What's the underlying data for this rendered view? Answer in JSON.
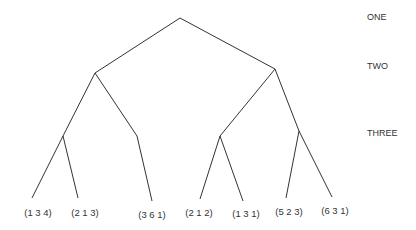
{
  "diagram": {
    "type": "tree",
    "level_labels": [
      {
        "label": "ONE",
        "x": 367,
        "y": 20
      },
      {
        "label": "TWO",
        "x": 367,
        "y": 69
      },
      {
        "label": "THREE",
        "x": 367,
        "y": 136
      }
    ],
    "nodes": {
      "root": {
        "x": 180,
        "y": 18
      },
      "L": {
        "x": 95,
        "y": 73
      },
      "R": {
        "x": 275,
        "y": 69
      },
      "LL": {
        "x": 63,
        "y": 136
      },
      "LR": {
        "x": 137,
        "y": 136
      },
      "RL": {
        "x": 220,
        "y": 136
      },
      "RR": {
        "x": 299,
        "y": 131
      }
    },
    "leaves": [
      {
        "label": "(1 3 4)",
        "x": 32,
        "y": 198,
        "label_x": 38,
        "label_y": 216
      },
      {
        "label": "(2 1 3)",
        "x": 78,
        "y": 198,
        "label_x": 85,
        "label_y": 216
      },
      {
        "label": "(3 6 1)",
        "x": 152,
        "y": 201,
        "label_x": 152,
        "label_y": 218
      },
      {
        "label": "(2 1 2)",
        "x": 200,
        "y": 199,
        "label_x": 199,
        "label_y": 216
      },
      {
        "label": "(1 3 1)",
        "x": 243,
        "y": 201,
        "label_x": 246,
        "label_y": 217
      },
      {
        "label": "(5 2 3)",
        "x": 286,
        "y": 198,
        "label_x": 289,
        "label_y": 215
      },
      {
        "label": "(6 3 1)",
        "x": 332,
        "y": 197,
        "label_x": 335,
        "label_y": 214
      }
    ],
    "edges": [
      [
        "root",
        "L"
      ],
      [
        "root",
        "R"
      ],
      [
        "L",
        "LL"
      ],
      [
        "L",
        "LR"
      ],
      [
        "R",
        "RL"
      ],
      [
        "R",
        "RR"
      ],
      [
        "LL",
        "leaf0"
      ],
      [
        "LL",
        "leaf1"
      ],
      [
        "LR",
        "leaf2"
      ],
      [
        "RL",
        "leaf3"
      ],
      [
        "RL",
        "leaf4"
      ],
      [
        "RR",
        "leaf5"
      ],
      [
        "RR",
        "leaf6"
      ]
    ]
  }
}
